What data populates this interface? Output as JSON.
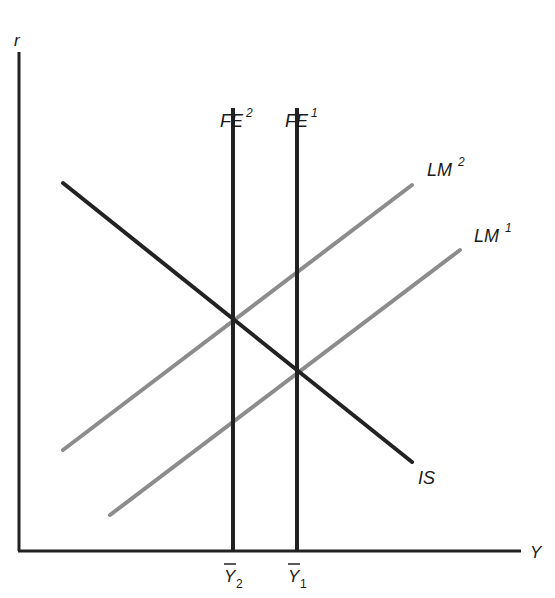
{
  "diagram": {
    "type": "IS-LM-FE economic model",
    "axes": {
      "y_label": "r",
      "x_label": "Y"
    },
    "curves": [
      {
        "id": "IS",
        "label": "IS",
        "color": "#222222",
        "kind": "downward-sloping"
      },
      {
        "id": "LM1",
        "label": "LM",
        "superscript": "1",
        "color": "#8c8c8c",
        "kind": "upward-sloping"
      },
      {
        "id": "LM2",
        "label": "LM",
        "superscript": "2",
        "color": "#8c8c8c",
        "kind": "upward-sloping"
      },
      {
        "id": "FE1",
        "label": "FE",
        "superscript": "1",
        "color": "#222222",
        "kind": "vertical"
      },
      {
        "id": "FE2",
        "label": "FE",
        "superscript": "2",
        "color": "#222222",
        "kind": "vertical"
      }
    ],
    "x_ticks": [
      {
        "label": "Y",
        "subscript": "2",
        "bar": true
      },
      {
        "label": "Y",
        "subscript": "1",
        "bar": true
      }
    ]
  },
  "labels": {
    "r": "r",
    "Y": "Y",
    "IS": "IS",
    "LM": "LM",
    "FE": "FE",
    "sup1": "1",
    "sup2": "2",
    "ybar": "Y",
    "sub1": "1",
    "sub2": "2"
  }
}
